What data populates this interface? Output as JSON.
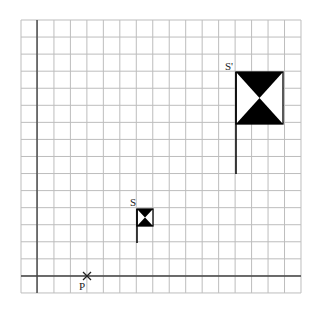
{
  "diagram": {
    "type": "enlargement-grid",
    "grid": {
      "x0": 21,
      "y0": 20,
      "cols": 17,
      "rows": 16,
      "cell_w": 16.47,
      "cell_h": 17.06,
      "line_color": "#bdbdbd",
      "axis_color": "#444444"
    },
    "axes": {
      "vertical_x": 37,
      "horizontal_y": 276
    },
    "point_P": {
      "label": "P",
      "x": 87,
      "y": 276
    },
    "flag_S": {
      "label": "S",
      "box": {
        "x": 137,
        "y": 209,
        "w": 16,
        "h": 17
      },
      "pole_bottom": 243
    },
    "flag_S_prime": {
      "label": "S'",
      "box": {
        "x": 236,
        "y": 72,
        "w": 47,
        "h": 52
      },
      "pole_bottom": 174
    },
    "fill_color": "#000000"
  }
}
